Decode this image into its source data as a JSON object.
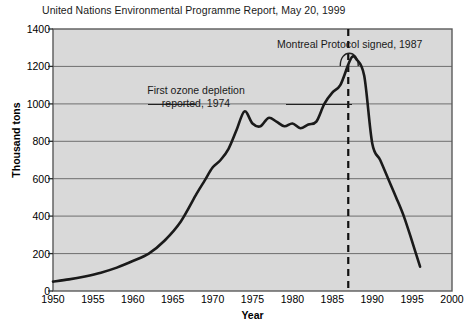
{
  "chart_data": {
    "type": "line",
    "title": "United Nations Environmental Programme Report, May 20, 1999",
    "xlabel": "Year",
    "ylabel": "Thousand tons",
    "xlim": [
      1950,
      2000
    ],
    "ylim": [
      0,
      1400
    ],
    "xticks": [
      "1950",
      "1955",
      "1960",
      "1965",
      "1970",
      "1975",
      "1980",
      "1985",
      "1990",
      "1995",
      "2000"
    ],
    "yticks": [
      "0",
      "200",
      "400",
      "600",
      "800",
      "1000",
      "1200",
      "1400"
    ],
    "grid": "horizontal",
    "legend": "none",
    "plot_background": "#d9d9d9",
    "line_color": "#1a1a1a",
    "series": [
      {
        "name": "CFC production",
        "x": [
          1950,
          1952,
          1954,
          1956,
          1958,
          1960,
          1962,
          1964,
          1966,
          1968,
          1969,
          1970,
          1971,
          1972,
          1973,
          1974,
          1975,
          1976,
          1977,
          1978,
          1979,
          1980,
          1981,
          1982,
          1983,
          1984,
          1985,
          1986,
          1987,
          1987.5,
          1988,
          1989,
          1990,
          1991,
          1992,
          1993,
          1994,
          1995,
          1996
        ],
        "y": [
          50,
          62,
          78,
          98,
          125,
          160,
          200,
          270,
          370,
          520,
          590,
          660,
          700,
          760,
          860,
          960,
          895,
          880,
          925,
          905,
          880,
          895,
          870,
          890,
          905,
          1000,
          1060,
          1100,
          1210,
          1252,
          1240,
          1150,
          790,
          700,
          600,
          500,
          395,
          265,
          130
        ]
      }
    ],
    "annotations": [
      {
        "id": "first-ozone-depletion",
        "line1": "First ozone depletion",
        "line2": "reported, 1974",
        "year": 1974
      },
      {
        "id": "montreal-protocol",
        "text": "Montreal Protocol signed, 1987",
        "year": 1987,
        "marker": "dashed-vertical-line"
      }
    ]
  }
}
